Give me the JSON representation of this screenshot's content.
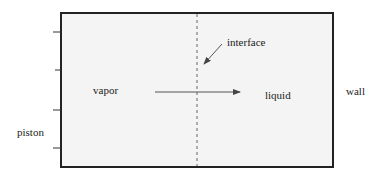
{
  "diagram": {
    "type": "schematic",
    "labels": {
      "interface": "interface",
      "vapor": "vapor",
      "liquid": "liquid",
      "wall": "wall",
      "piston": "piston"
    },
    "colors": {
      "stroke": "#222222",
      "fill": "#f4f4f4",
      "arrow": "#555555",
      "dashed": "#666666"
    },
    "container": {
      "x": 61,
      "y": 13,
      "width": 272,
      "height": 154
    },
    "interface_line": {
      "x": 197,
      "y1": 13,
      "y2": 167,
      "style": "dashed"
    },
    "piston_ticks_y": [
      32,
      70,
      110,
      148
    ],
    "flow_arrow": {
      "x1": 155,
      "y1": 92,
      "x2": 240,
      "y2": 92
    },
    "interface_pointer": {
      "x1": 222,
      "y1": 44,
      "x2": 204,
      "y2": 64
    }
  }
}
